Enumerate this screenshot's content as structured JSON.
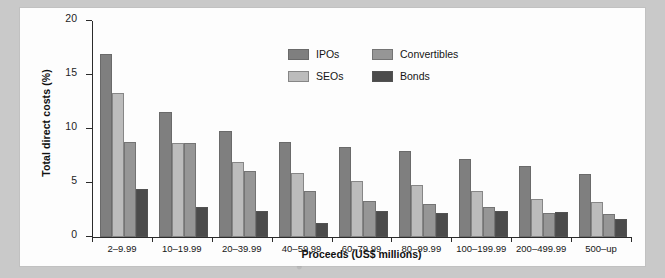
{
  "chart_data": {
    "type": "bar",
    "title": "",
    "xlabel": "Proceeds (US$ millions)",
    "ylabel": "Total direct costs (%)",
    "ylim": [
      0,
      20
    ],
    "yticks": [
      0,
      5,
      10,
      15,
      20
    ],
    "ytick_labels": [
      "0",
      "5",
      "10",
      "15",
      "20"
    ],
    "grid": false,
    "legend_position": "upper center",
    "categories": [
      "2–9.99",
      "10–19.99",
      "20–39.99",
      "40–59.99",
      "60–79.99",
      "80–99.99",
      "100–199.99",
      "200–499.99",
      "500–up"
    ],
    "series": [
      {
        "name": "IPOs",
        "color": "#7f7f7f",
        "values": [
          16.9,
          11.6,
          9.8,
          8.8,
          8.3,
          8.0,
          7.2,
          6.6,
          5.8
        ]
      },
      {
        "name": "SEOs",
        "color": "#bcbcbc",
        "values": [
          13.3,
          8.7,
          6.9,
          5.9,
          5.2,
          4.8,
          4.3,
          3.5,
          3.2
        ]
      },
      {
        "name": "Convertibles",
        "color": "#969696",
        "values": [
          8.8,
          8.7,
          6.1,
          4.3,
          3.3,
          3.1,
          2.8,
          2.2,
          2.1
        ]
      },
      {
        "name": "Bonds",
        "color": "#4b4b4b",
        "values": [
          4.4,
          2.8,
          2.4,
          1.3,
          2.4,
          2.2,
          2.4,
          2.3,
          1.7
        ]
      }
    ]
  },
  "colors": {
    "page_background": "#c9c9c9",
    "card_background": "#fdfdfd",
    "axis": "#2b2b2b",
    "text": "#151515"
  }
}
